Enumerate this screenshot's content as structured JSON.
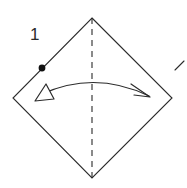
{
  "figure": {
    "step_label": "1",
    "background_color": "#ffffff",
    "line_color": "#2b2b2b",
    "dot_color": "#111111"
  },
  "shape": {
    "name": "square-rotated-45",
    "description": "Square paper oriented as a diamond",
    "vertices": {
      "top": [
        92,
        18
      ],
      "right": [
        172,
        98
      ],
      "bottom": [
        92,
        178
      ],
      "left": [
        13,
        98
      ]
    },
    "stroke_width": 1.1
  },
  "fold_line": {
    "name": "vertical-dashed-crease",
    "style": "dashed",
    "from": [
      92,
      18
    ],
    "to": [
      92,
      178
    ],
    "dash_pattern": "6 5",
    "stroke_width": 1.1
  },
  "reference_dot": {
    "name": "corner-reference-dot",
    "position": [
      42,
      68
    ],
    "radius": 3.4
  },
  "fold_arrow": {
    "name": "fold-right-arrow",
    "description": "Curved arrow indicating folding left edge over to the right",
    "path": "M 42,94 Q 95,70 149,96",
    "arrowhead_right": {
      "type": "open-barb",
      "tip": [
        150,
        97
      ]
    },
    "arrowhead_left": {
      "type": "hollow-triangle",
      "tip": [
        35,
        101
      ]
    },
    "stroke_width": 1.2
  },
  "edge_mark": {
    "name": "adjacent-figure-edge-stroke",
    "from": [
      175,
      70
    ],
    "to": [
      184,
      61
    ],
    "stroke_width": 1.1
  }
}
